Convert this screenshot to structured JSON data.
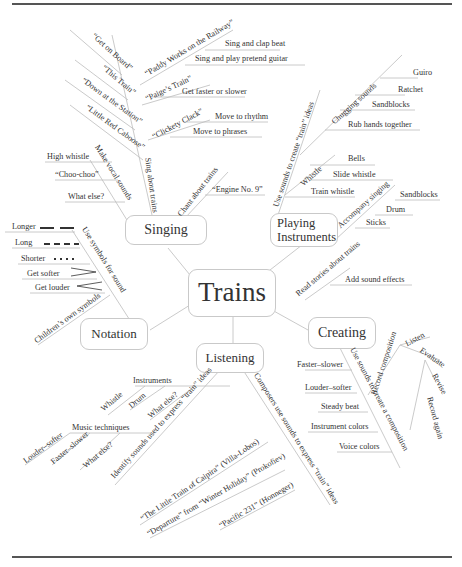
{
  "central": {
    "label": "Trains"
  },
  "nodes": {
    "singing": "Singing",
    "playing_line1": "Playing",
    "playing_line2": "Instruments",
    "notation": "Notation",
    "listening": "Listening",
    "creating": "Creating"
  },
  "singing": {
    "sing_about_trains": "Sing about trains",
    "songs": [
      "“Get on Board”",
      "“This Train”",
      "“Down at the Station”",
      "“Little Red Caboose”"
    ],
    "paddy": "“Paddy Works on the Railway”",
    "paddy_items": [
      "Sing and clap beat",
      "Sing and play pretend guitar"
    ],
    "paige": "“Paige’s Train”",
    "paige_items": [
      "Get faster or slower"
    ],
    "clickety": "“Clickety Clack”",
    "clickety_items": [
      "Move to rhythm",
      "Move to phrases"
    ],
    "vocal": "Make vocal sounds",
    "vocal_items": [
      "High whistle",
      "“Choo-choo”",
      "What else?"
    ],
    "chant": "Chant about trains",
    "chant_items": [
      "“Engine No. 9”"
    ]
  },
  "playing": {
    "use_sounds": "Use sounds to create “train” ideas",
    "chugging": "Chugging sounds",
    "chugging_items": [
      "Guiro",
      "Ratchet",
      "Sandblocks",
      "Rub hands together"
    ],
    "whistle": "Whistle",
    "whistle_items": [
      "Bells",
      "Slide whistle",
      "Train whistle"
    ],
    "accompany": "Accompany singing",
    "accompany_items": [
      "Sandblocks",
      "Drum",
      "Sticks"
    ]
  },
  "notation": {
    "use_symbols": "Use symbols for sound",
    "symbols": [
      {
        "label": "Longer",
        "glyph": "longer"
      },
      {
        "label": "Long",
        "glyph": "long"
      },
      {
        "label": "Shorter",
        "glyph": "shorter"
      },
      {
        "label": "Get softer",
        "glyph": "decrescendo"
      },
      {
        "label": "Get louder",
        "glyph": "crescendo"
      }
    ],
    "own": "Children’s own symbols"
  },
  "listening": {
    "identify": "Identify sounds used to express “train” ideas",
    "instruments": "Instruments",
    "instrument_items": [
      "Whistle",
      "Drum",
      "What else?"
    ],
    "techniques": "Music techniques",
    "technique_items": [
      "Louder–softer",
      "Faster–slower",
      "What else?"
    ],
    "composers": "Composers use sounds to express “train” ideas",
    "works": [
      "“The Little Train of Caipira” (Villa-Lobos)",
      "“Departure” from “Winter Holiday” (Prokofiev)",
      "“Pacific 231” (Honneger)"
    ]
  },
  "creating": {
    "read_stories": "Read stories about trains",
    "read_items": [
      "Add sound effects"
    ],
    "use_sounds": "Use sounds to create a composition",
    "use_items": [
      "Faster–slower",
      "Louder–softer",
      "Steady beat",
      "Instrument colors",
      "Voice colors"
    ],
    "record": "Record composition",
    "cycle": [
      "Listen",
      "Evaluate",
      "Revise",
      "Record again"
    ]
  }
}
